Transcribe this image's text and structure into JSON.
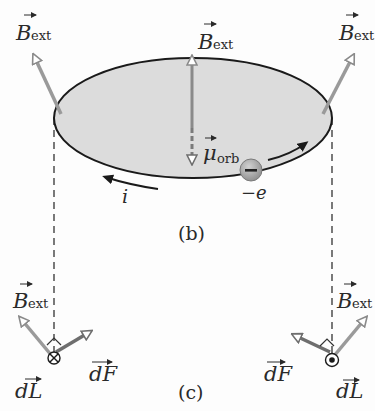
{
  "figure": {
    "panel_b_caption": "(b)",
    "panel_c_caption": "(c)"
  },
  "labels": {
    "b_ext_main": "B",
    "b_ext_sub": "ext",
    "mu_main": "μ",
    "mu_sub": "orb",
    "electron_charge": "−e",
    "electron_symbol": "−",
    "current": "i",
    "dL_main": "dL",
    "dF_main": "dF"
  },
  "colors": {
    "orbit_fill": "#d9d9d9",
    "orbit_stroke": "#1a1a1a",
    "field_arrow": "#9a9a9a",
    "force_arrow": "#6e6e6e",
    "electron_fill": "#b0b0b0",
    "text": "#2a2a2a"
  }
}
